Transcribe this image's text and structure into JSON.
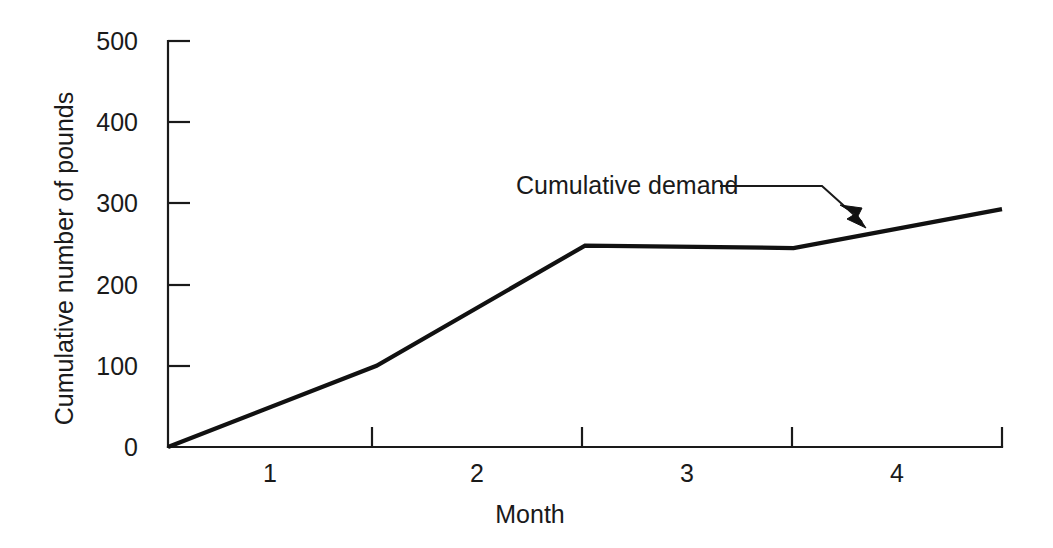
{
  "chart_data": {
    "type": "line",
    "title": "",
    "xlabel": "Month",
    "ylabel": "Cumulative number of pounds",
    "xlim": [
      0.5,
      4.5
    ],
    "ylim": [
      0,
      500
    ],
    "grid": false,
    "legend": "none",
    "y_ticks": [
      500,
      400,
      300,
      200,
      100,
      0
    ],
    "y_tick_labels": [
      "500",
      "400",
      "300",
      "200",
      "100",
      "0"
    ],
    "x_tick_positions": [
      0.5,
      1.5,
      2.5,
      3.5,
      4.5
    ],
    "x_category_labels": [
      "1",
      "2",
      "3",
      "4"
    ],
    "x_category_centers": [
      1,
      2,
      3,
      4
    ],
    "series": [
      {
        "name": "Cumulative demand",
        "x": [
          0.5,
          1.5,
          2.5,
          3.5,
          4.5
        ],
        "values": [
          0,
          100,
          248,
          245,
          293
        ]
      }
    ],
    "annotations": [
      {
        "text": "Cumulative demand",
        "target_x": 3.85,
        "target_y": 268
      }
    ],
    "colors": {
      "line": "#111111",
      "axis": "#1a1a1a",
      "background": "#ffffff"
    }
  },
  "axis": {
    "y_labels": [
      "500",
      "400",
      "300",
      "200",
      "100",
      "0"
    ],
    "x_labels": [
      "1",
      "2",
      "3",
      "4"
    ],
    "y_title": "Cumulative number of pounds",
    "x_title": "Month"
  },
  "annotation": {
    "series_label": "Cumulative demand"
  }
}
